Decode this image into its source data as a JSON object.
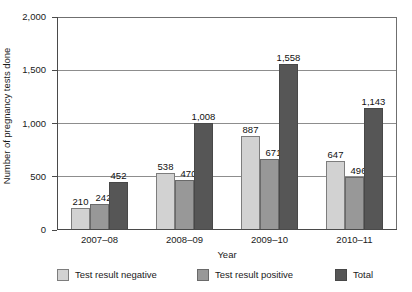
{
  "chart_data": {
    "type": "bar",
    "title": "",
    "subtitle": "",
    "xlabel": "Year",
    "ylabel": "Number of pregnancy tests done",
    "categories": [
      "2007–08",
      "2008–09",
      "2009–10",
      "2010–11"
    ],
    "series": [
      {
        "name": "Test result negative",
        "values": [
          210,
          538,
          887,
          647
        ],
        "color": "#d2d2d2"
      },
      {
        "name": "Test result positive",
        "values": [
          242,
          470,
          671,
          496
        ],
        "color": "#989898"
      },
      {
        "name": "Total",
        "values": [
          452,
          1008,
          1558,
          1143
        ],
        "color": "#565656"
      }
    ],
    "value_labels": [
      [
        "210",
        "538",
        "887",
        "647"
      ],
      [
        "242",
        "470",
        "671",
        "496"
      ],
      [
        "452",
        "1,008",
        "1,558",
        "1,143"
      ]
    ],
    "ylim": [
      0,
      2000
    ],
    "yticks": [
      0,
      500,
      1000,
      1500,
      2000
    ],
    "ytick_labels": [
      "0",
      "500",
      "1,000",
      "1,500",
      "2,000"
    ],
    "grid": true,
    "legend_position": "bottom"
  },
  "legend": {
    "items": [
      {
        "label": "Test result negative"
      },
      {
        "label": "Test result positive"
      },
      {
        "label": "Total"
      }
    ]
  }
}
